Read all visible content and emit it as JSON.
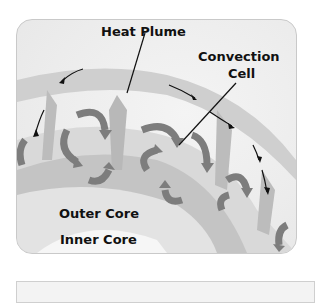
{
  "diagram": {
    "labels": {
      "heat_plume": "Heat Plume",
      "convection_cell_line1": "Convection",
      "convection_cell_line2": "Cell",
      "outer_core": "Outer Core",
      "inner_core": "Inner Core"
    },
    "colors": {
      "mantle_light": "#e8e8e8",
      "plume_gray": "#bdbdbd",
      "arrow_gray": "#7d7d7d",
      "text": "#111111",
      "border": "#c9c9c9"
    }
  }
}
